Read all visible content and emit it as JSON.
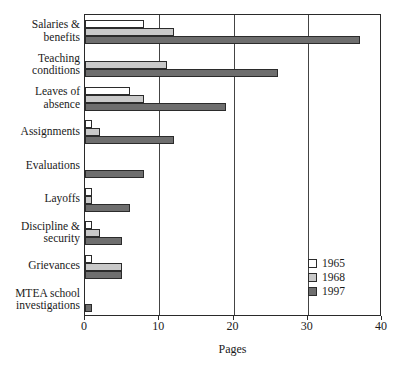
{
  "chart_data": {
    "type": "bar",
    "orientation": "horizontal",
    "title": "",
    "xlabel": "Pages",
    "ylabel": "",
    "xlim": [
      0,
      40
    ],
    "xticks": [
      0,
      10,
      20,
      30,
      40
    ],
    "grid": true,
    "legend_position": "bottom-right",
    "categories": [
      "Salaries &\nbenefits",
      "Teaching\nconditions",
      "Leaves of\nabsence",
      "Assignments",
      "Evaluations",
      "Layoffs",
      "Discipline &\nsecurity",
      "Grievances",
      "MTEA school\ninvestigations"
    ],
    "series": [
      {
        "name": "1965",
        "color": "#ffffff",
        "values": [
          8,
          0,
          6,
          1,
          0,
          1,
          1,
          1,
          0
        ]
      },
      {
        "name": "1968",
        "color": "#c9c9c9",
        "values": [
          12,
          11,
          8,
          2,
          0,
          1,
          2,
          5,
          0
        ]
      },
      {
        "name": "1997",
        "color": "#6e6e6e",
        "values": [
          37,
          26,
          19,
          12,
          8,
          6,
          5,
          5,
          1
        ]
      }
    ]
  },
  "legend": {
    "entries": [
      {
        "label": "1965",
        "color": "#ffffff"
      },
      {
        "label": "1968",
        "color": "#c9c9c9"
      },
      {
        "label": "1997",
        "color": "#6e6e6e"
      }
    ]
  },
  "axis": {
    "x_title": "Pages",
    "tick_labels": [
      "0",
      "10",
      "20",
      "30",
      "40"
    ]
  }
}
